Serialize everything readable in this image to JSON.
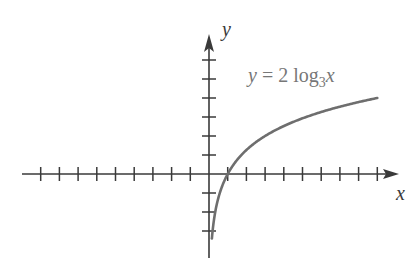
{
  "panel_label": "(b)",
  "chart_data": {
    "type": "line",
    "title": "",
    "function": "y = 2 log_3 x",
    "annotation": {
      "text": "y = 2 log",
      "subscript": "3",
      "var": "x"
    },
    "xlabel": "x",
    "ylabel": "y",
    "xlim": [
      -10,
      10
    ],
    "ylim": [
      -4,
      7
    ],
    "x_ticks": [
      -9,
      -8,
      -7,
      -6,
      -5,
      -4,
      -3,
      -2,
      -1,
      1,
      2,
      3,
      4,
      5,
      6,
      7,
      8,
      9
    ],
    "y_ticks": [
      -3,
      -2,
      -1,
      1,
      2,
      3,
      4,
      5,
      6
    ],
    "tick_labels_shown": false,
    "grid": false,
    "series": [
      {
        "name": "y = 2 log_3 x",
        "color": "#6e6e6e",
        "x": [
          0.15,
          0.2,
          0.33,
          0.5,
          1,
          2,
          3,
          4,
          5,
          6,
          7,
          8,
          9
        ],
        "y": [
          -3.45,
          -2.93,
          -2.0,
          -1.26,
          0,
          1.26,
          2.0,
          2.52,
          2.93,
          3.26,
          3.54,
          3.79,
          4.0
        ]
      }
    ],
    "colors": {
      "axis": "#3a3a3a",
      "curve": "#6e6e6e",
      "label": "#777777"
    }
  }
}
